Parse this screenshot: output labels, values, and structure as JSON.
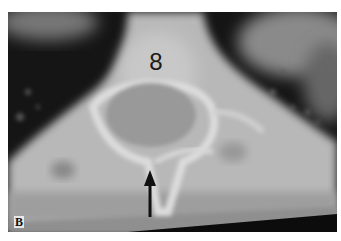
{
  "figure": {
    "panel_label": "B",
    "vertebra_label": "8",
    "annotations": [
      {
        "type": "arrow",
        "direction": "up",
        "color": "#111111"
      }
    ]
  }
}
